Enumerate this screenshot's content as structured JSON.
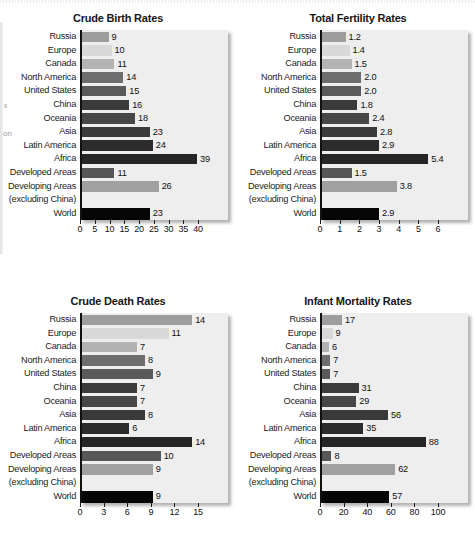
{
  "page": {
    "background": "#ffffff",
    "margin_fragments": [
      {
        "text": "s",
        "x": 4,
        "y": 101,
        "italic": true
      },
      {
        "text": "on",
        "x": 3,
        "y": 129,
        "italic": false
      }
    ]
  },
  "palette": {
    "plot_background": "#eeeeee",
    "axis": "#111111",
    "text": "#1d1d1d",
    "bar_colors": [
      "#9d9d9d",
      "#d8d8d8",
      "#b3b3b3",
      "#6e6e6e",
      "#5a5a5a",
      "#3b3b3b",
      "#474747",
      "#3a3a3a",
      "#2c2c2c",
      "#262626",
      "#565656",
      "#a0a0a0",
      "#eeeeee",
      "#060606"
    ]
  },
  "categories": [
    "Russia",
    "Europe",
    "Canada",
    "North America",
    "United States",
    "China",
    "Oceania",
    "Asia",
    "Latin America",
    "Africa",
    "Developed Areas",
    "Developing Areas",
    "(excluding China)",
    "World"
  ],
  "chart_data": [
    {
      "type": "bar",
      "orientation": "horizontal",
      "title": "Crude Birth Rates",
      "position": "top-left",
      "categories": [
        "Russia",
        "Europe",
        "Canada",
        "North America",
        "United States",
        "China",
        "Oceania",
        "Asia",
        "Latin America",
        "Africa",
        "Developed Areas",
        "Developing Areas",
        "(excluding China)",
        "World"
      ],
      "values": [
        9,
        10,
        11,
        14,
        15,
        16,
        18,
        23,
        24,
        39,
        11,
        26,
        null,
        23
      ],
      "value_labels": [
        "9",
        "10",
        "11",
        "14",
        "15",
        "16",
        "18",
        "23",
        "24",
        "39",
        "11",
        "26",
        "",
        "23"
      ],
      "xlabel": "",
      "ylabel": "",
      "xlim": [
        0,
        40
      ],
      "xticks": [
        0,
        5,
        10,
        15,
        20,
        25,
        30,
        35,
        40
      ],
      "xticklabels": [
        "0",
        "5",
        "10",
        "15",
        "20",
        "25",
        "30",
        "35",
        "40"
      ],
      "grid": false,
      "legend": "none"
    },
    {
      "type": "bar",
      "orientation": "horizontal",
      "title": "Total Fertility Rates",
      "position": "top-right",
      "categories": [
        "Russia",
        "Europe",
        "Canada",
        "North America",
        "United States",
        "China",
        "Oceania",
        "Asia",
        "Latin America",
        "Africa",
        "Developed Areas",
        "Developing Areas",
        "(excluding China)",
        "World"
      ],
      "values": [
        1.2,
        1.4,
        1.5,
        2.0,
        2.0,
        1.8,
        2.4,
        2.8,
        2.9,
        5.4,
        1.5,
        3.8,
        null,
        2.9
      ],
      "value_labels": [
        "1.2",
        "1.4",
        "1.5",
        "2.0",
        "2.0",
        "1.8",
        "2.4",
        "2.8",
        "2.9",
        "5.4",
        "1.5",
        "3.8",
        "",
        "2.9"
      ],
      "xlabel": "",
      "ylabel": "",
      "xlim": [
        0,
        6
      ],
      "xticks": [
        0,
        1,
        2,
        3,
        4,
        5,
        6
      ],
      "xticklabels": [
        "0",
        "1",
        "2",
        "3",
        "4",
        "5",
        "6"
      ],
      "grid": false,
      "legend": "none"
    },
    {
      "type": "bar",
      "orientation": "horizontal",
      "title": "Crude Death Rates",
      "position": "bottom-left",
      "categories": [
        "Russia",
        "Europe",
        "Canada",
        "North America",
        "United States",
        "China",
        "Oceania",
        "Asia",
        "Latin America",
        "Africa",
        "Developed Areas",
        "Developing Areas",
        "(excluding China)",
        "World"
      ],
      "values": [
        14,
        11,
        7,
        8,
        9,
        7,
        7,
        8,
        6,
        14,
        10,
        9,
        null,
        9
      ],
      "value_labels": [
        "14",
        "11",
        "7",
        "8",
        "9",
        "7",
        "7",
        "8",
        "6",
        "14",
        "10",
        "9",
        "",
        "9"
      ],
      "xlabel": "",
      "ylabel": "",
      "xlim": [
        0,
        15
      ],
      "xticks": [
        0,
        3,
        6,
        9,
        12,
        15
      ],
      "xticklabels": [
        "0",
        "3",
        "6",
        "9",
        "12",
        "15"
      ],
      "grid": false,
      "legend": "none"
    },
    {
      "type": "bar",
      "orientation": "horizontal",
      "title": "Infant Mortality Rates",
      "position": "bottom-right",
      "categories": [
        "Russia",
        "Europe",
        "Canada",
        "North America",
        "United States",
        "China",
        "Oceania",
        "Asia",
        "Latin America",
        "Africa",
        "Developed Areas",
        "Developing Areas",
        "(excluding China)",
        "World"
      ],
      "values": [
        17,
        9,
        6,
        7,
        7,
        31,
        29,
        56,
        35,
        88,
        8,
        62,
        null,
        57
      ],
      "value_labels": [
        "17",
        "9",
        "6",
        "7",
        "7",
        "31",
        "29",
        "56",
        "35",
        "88",
        "8",
        "62",
        "",
        "57"
      ],
      "xlabel": "",
      "ylabel": "",
      "xlim": [
        0,
        100
      ],
      "xticks": [
        0,
        20,
        40,
        60,
        80,
        100
      ],
      "xticklabels": [
        "0",
        "20",
        "40",
        "60",
        "80",
        "100"
      ],
      "grid": false,
      "legend": "none"
    }
  ]
}
